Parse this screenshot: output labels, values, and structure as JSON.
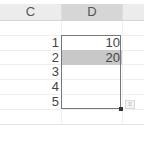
{
  "sheet": {
    "columns": [
      {
        "label": "C"
      },
      {
        "label": "D",
        "selected": true
      },
      {
        "label": ""
      }
    ],
    "rows": [
      {
        "label": "1",
        "value": "10"
      },
      {
        "label": "2",
        "value": "20",
        "highlighted": true
      },
      {
        "label": "3",
        "value": ""
      },
      {
        "label": "4",
        "value": ""
      },
      {
        "label": "5",
        "value": ""
      }
    ],
    "quick_analysis_icon": "quick-analysis-icon",
    "colors": {
      "selected_header": "#d6d6d6",
      "highlight_cell": "#c8c8c8",
      "range_border": "#777777"
    }
  }
}
